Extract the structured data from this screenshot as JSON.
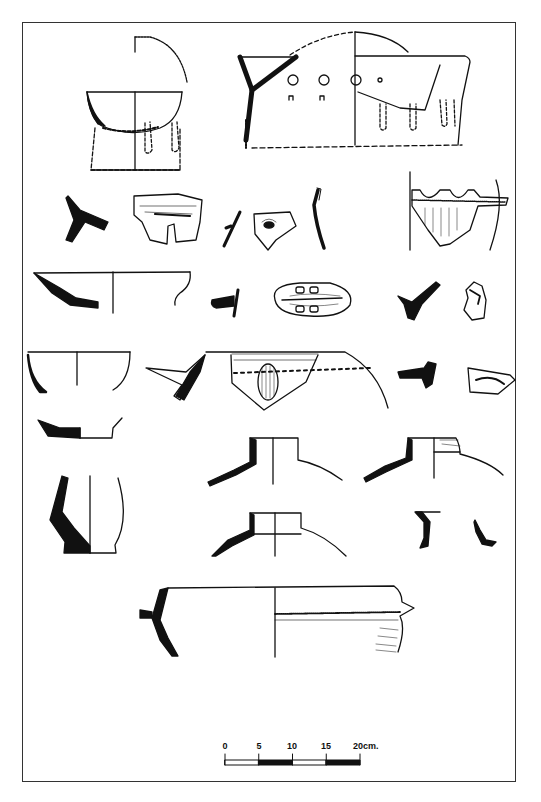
{
  "plate": {
    "type": "archaeological pottery drawing plate",
    "background": "#ffffff",
    "ink": "#111111"
  },
  "scale_bar": {
    "labels": [
      "0",
      "5",
      "10",
      "15",
      "20cm."
    ],
    "unit": "cm",
    "max": 20,
    "step": 5,
    "segments": [
      "white",
      "black",
      "white",
      "black"
    ]
  },
  "figures": [
    {
      "id": "bowl-on-feet",
      "row": 1,
      "description": "Footed bowl with handle arc, section + elevation"
    },
    {
      "id": "perforated-vessel",
      "row": 1,
      "description": "Large perforated vessel with dashed reconstruction"
    },
    {
      "id": "section-y-1",
      "row": 2,
      "description": "Solid Y-shaped rim section"
    },
    {
      "id": "decorated-sherd-1",
      "row": 2,
      "description": "Sherd with incised/applied decoration"
    },
    {
      "id": "small-rim-section",
      "row": 2,
      "description": "Small thin rim section"
    },
    {
      "id": "lug-sherd",
      "row": 2,
      "description": "Pentagonal sherd with lug"
    },
    {
      "id": "curved-wall-section",
      "row": 2,
      "description": "Curved wall section"
    },
    {
      "id": "scalloped-rim-vessel",
      "row": 2,
      "description": "Vessel with scalloped rim and hatched body"
    },
    {
      "id": "shallow-dish",
      "row": 3,
      "description": "Shallow dish profile"
    },
    {
      "id": "small-flange-section",
      "row": 3,
      "description": "Small flanged section"
    },
    {
      "id": "double-lug-sherd",
      "row": 3,
      "description": "Oval sherd with double lug decoration"
    },
    {
      "id": "carinated-section",
      "row": 3,
      "description": "Carinated section"
    },
    {
      "id": "handle-fragment",
      "row": 3,
      "description": "Handle fragment"
    },
    {
      "id": "deep-bowl",
      "row": 4,
      "description": "Deep bowl profile"
    },
    {
      "id": "flanged-section-2",
      "row": 4,
      "description": "Flanged rim section"
    },
    {
      "id": "large-bowl-lug",
      "row": 4,
      "description": "Large bowl with applied lug and dotted line"
    },
    {
      "id": "small-section-3",
      "row": 4,
      "description": "Small rim section"
    },
    {
      "id": "decorated-sherd-2",
      "row": 4,
      "description": "Decorated body sherd"
    },
    {
      "id": "base-fragment",
      "row": 5,
      "description": "Base fragment"
    },
    {
      "id": "jar-neck-1",
      "row": 5,
      "description": "Jar neck and shoulder"
    },
    {
      "id": "jar-neck-2",
      "row": 5,
      "description": "Jar neck and shoulder, shaded"
    },
    {
      "id": "carinated-jar",
      "row": 6,
      "description": "Carinated jar profile"
    },
    {
      "id": "jar-neck-3",
      "row": 6,
      "description": "Jar neck and shoulder"
    },
    {
      "id": "rim-fragments",
      "row": 6,
      "description": "Two rim fragments"
    },
    {
      "id": "large-flanged-bowl",
      "row": 7,
      "description": "Large bowl with lug flange"
    }
  ]
}
